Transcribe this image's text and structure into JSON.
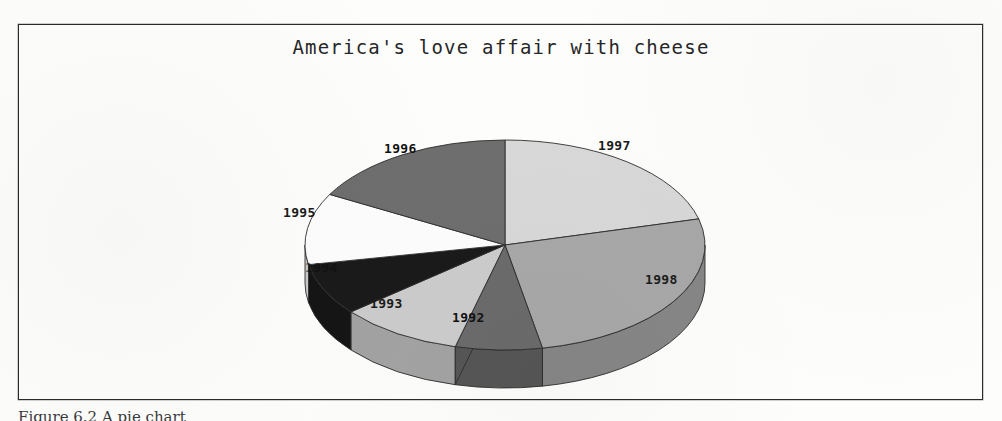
{
  "figure": {
    "caption": "Figure 6.2  A pie chart",
    "frame_color": "#2a2a2a"
  },
  "chart_data": {
    "type": "pie",
    "title": "America's love affair with cheese",
    "xlabel": "",
    "ylabel": "",
    "legend_position": "none",
    "labels_on_slices": true,
    "grid": false,
    "categories": [
      "1992",
      "1993",
      "1994",
      "1995",
      "1996",
      "1997",
      "1998"
    ],
    "values": [
      7,
      10,
      8,
      11,
      17,
      21,
      26
    ],
    "units": "percent",
    "slices": [
      {
        "label": "1997",
        "value": 21,
        "color": "#d8d8d8",
        "start_angle": 0,
        "end_angle": 75.6,
        "label_x": 598,
        "label_y": 138
      },
      {
        "label": "1998",
        "value": 26,
        "color": "#a8a8a8",
        "start_angle": 75.6,
        "end_angle": 169.2,
        "label_x": 645,
        "label_y": 272
      },
      {
        "label": "1992",
        "value": 7,
        "color": "#6b6b6b",
        "start_angle": 169.2,
        "end_angle": 194.4,
        "label_x": 452,
        "label_y": 310
      },
      {
        "label": "1993",
        "value": 10,
        "color": "#cccccc",
        "start_angle": 194.4,
        "end_angle": 230.4,
        "label_x": 370,
        "label_y": 296
      },
      {
        "label": "1994",
        "value": 8,
        "color": "#1a1a1a",
        "start_angle": 230.4,
        "end_angle": 259.2,
        "label_x": 305,
        "label_y": 260
      },
      {
        "label": "1995",
        "value": 11,
        "color": "#fdfdfd",
        "start_angle": 259.2,
        "end_angle": 298.8,
        "label_x": 283,
        "label_y": 205
      },
      {
        "label": "1996",
        "value": 17,
        "color": "#6e6e6e",
        "start_angle": 298.8,
        "end_angle": 360,
        "label_x": 384,
        "label_y": 141
      }
    ]
  }
}
